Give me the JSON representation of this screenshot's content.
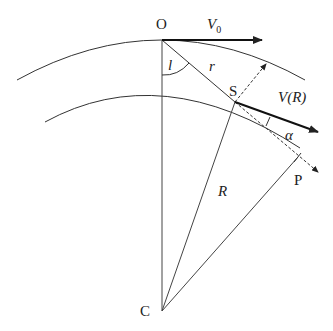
{
  "diagram": {
    "type": "geometry",
    "points": {
      "O": {
        "label": "O",
        "x": 162,
        "y": 40
      },
      "S": {
        "label": "S",
        "x": 235,
        "y": 102
      },
      "C": {
        "label": "C",
        "x": 162,
        "y": 311
      },
      "P": {
        "label": "P",
        "x": 298,
        "y": 157
      }
    },
    "vectors": {
      "V0": {
        "label": "V",
        "sub": "0"
      },
      "VR": {
        "label": "V(R)"
      }
    },
    "labels": {
      "l": "l",
      "r": "r",
      "R": "R",
      "alpha": "α"
    },
    "colors": {
      "line": "#333333",
      "background": "#ffffff"
    }
  }
}
